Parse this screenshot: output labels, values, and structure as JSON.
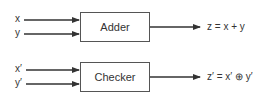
{
  "diagram": {
    "adder": {
      "label": "Adder",
      "inputs": [
        "x",
        "y"
      ],
      "output": "z = x + y"
    },
    "checker": {
      "label": "Checker",
      "inputs": [
        "x′",
        "y′"
      ],
      "output": "z′ = x′ ⊕ y′"
    },
    "colors": {
      "line": "#333333",
      "box_border": "#555555",
      "text": "#333333"
    }
  }
}
